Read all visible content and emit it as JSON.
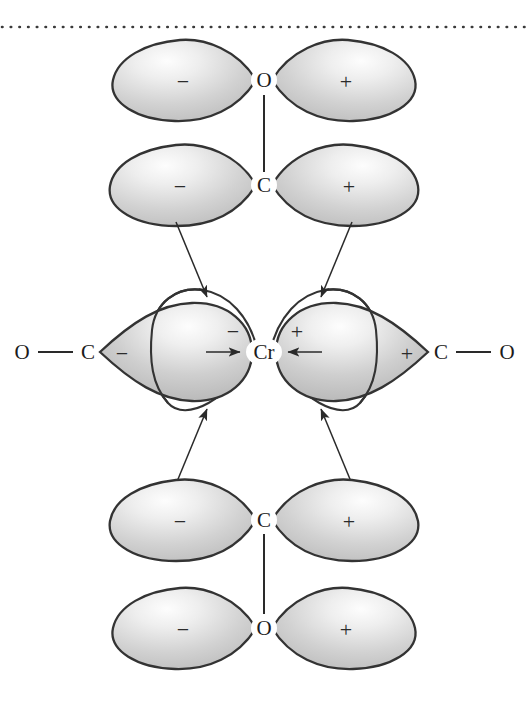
{
  "figure": {
    "background_color": "#ffffff",
    "outline_color": "#333333",
    "lobe_fill_light": "#f2f2f2",
    "lobe_fill_mid": "#c9c9c9",
    "lobe_fill_dark": "#b4b4b4",
    "ink_color": "#2a2a2a"
  },
  "divider": {
    "name": "dotted-rule",
    "style": "dotted",
    "y": 27
  },
  "metal": {
    "symbol": "Cr",
    "x": 264,
    "y": 352
  },
  "orbitals": [
    {
      "id": "top-oxygen-p",
      "atom": "O",
      "atom_x": 264,
      "atom_y": 80,
      "left_sign": "−",
      "right_sign": "+",
      "kind": "p-orbital",
      "fill": "filled"
    },
    {
      "id": "upper-carbon-p",
      "atom": "C",
      "atom_x": 264,
      "atom_y": 185,
      "left_sign": "−",
      "right_sign": "+",
      "kind": "p-orbital",
      "fill": "filled"
    },
    {
      "id": "lower-carbon-p",
      "atom": "C",
      "atom_x": 264,
      "atom_y": 520,
      "left_sign": "−",
      "right_sign": "+",
      "kind": "p-orbital",
      "fill": "filled"
    },
    {
      "id": "bottom-oxygen-p",
      "atom": "O",
      "atom_x": 264,
      "atom_y": 628,
      "left_sign": "−",
      "right_sign": "+",
      "kind": "p-orbital",
      "fill": "filled"
    }
  ],
  "metal_d_orbital": {
    "left_sign": "−",
    "right_sign": "+",
    "left_sign_x": 233,
    "left_sign_y": 332,
    "right_sign_x": 296,
    "right_sign_y": 332,
    "kind": "d-orbital",
    "fill": "open"
  },
  "horizontal_ligands": {
    "left": {
      "oxygen": "O",
      "oxygen_x": 22,
      "carbon": "C",
      "carbon_x": 88,
      "y": 352,
      "lobe_sign": "−",
      "lobe_sign_x": 122,
      "bond_label": "O — C"
    },
    "right": {
      "oxygen": "O",
      "oxygen_x": 507,
      "carbon": "C",
      "carbon_x": 441,
      "y": 352,
      "lobe_sign": "+",
      "lobe_sign_x": 407,
      "bond_label": "C — O"
    }
  },
  "bonds": [
    {
      "id": "top-o-c-bond",
      "x": 264,
      "y1": 95,
      "y2": 170
    },
    {
      "id": "bottom-c-o-bond",
      "x": 264,
      "y1": 535,
      "y2": 613
    }
  ],
  "overlap_arrows": [
    {
      "id": "upper-left-donation",
      "from": "upper-carbon-minus-lobe",
      "to": "metal-d-minus-lobe",
      "direction": "down-right"
    },
    {
      "id": "upper-right-donation",
      "from": "upper-carbon-plus-lobe",
      "to": "metal-d-plus-lobe",
      "direction": "down-left"
    },
    {
      "id": "lower-left-donation",
      "from": "lower-carbon-minus-lobe",
      "to": "metal-d-minus-lobe",
      "direction": "up-right"
    },
    {
      "id": "lower-right-donation",
      "from": "lower-carbon-plus-lobe",
      "to": "metal-d-plus-lobe",
      "direction": "up-left"
    },
    {
      "id": "left-sigma-donation",
      "from": "left-carbonyl-lobe",
      "to": "metal-center",
      "direction": "right"
    },
    {
      "id": "right-sigma-donation",
      "from": "right-carbonyl-lobe",
      "to": "metal-center",
      "direction": "left"
    }
  ]
}
